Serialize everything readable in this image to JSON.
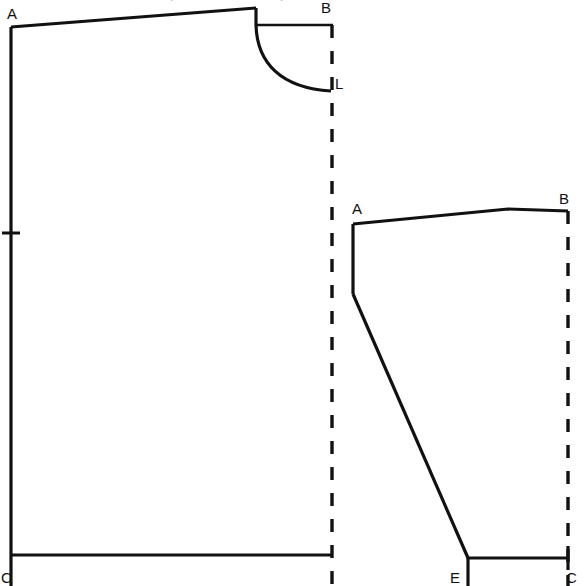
{
  "figure": {
    "title_fragment_top": "pattern draft diagram",
    "background_color": "#ffffff",
    "line_color": "#111111",
    "width": 585,
    "height": 586
  },
  "left_piece": {
    "name": "bodice-block",
    "labels": {
      "top_left": "A",
      "top_right": "B",
      "neck_lower": "L",
      "bottom_left": "C"
    },
    "fold_line_x": 332,
    "notch_y": 233
  },
  "right_piece": {
    "name": "sleeve-block",
    "labels": {
      "top_left": "A",
      "top_right": "B",
      "hem_left": "E",
      "hem_right": "C"
    },
    "fold_line_x": 568
  },
  "legend": {
    "solid_line_meaning": "cutting line",
    "dashed_line_meaning": "fold line",
    "tick_meaning": "balance notch"
  }
}
